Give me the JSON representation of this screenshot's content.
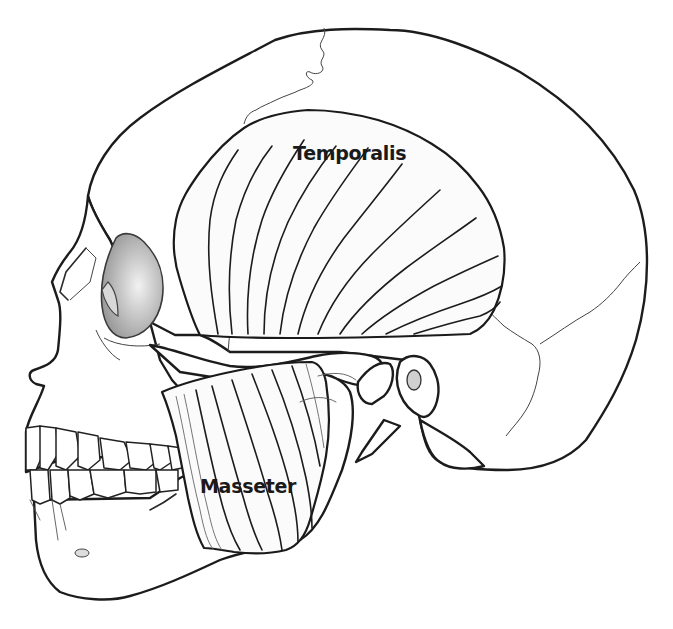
{
  "figure": {
    "labels": {
      "temporalis": "Temporalis",
      "masseter": "Masseter"
    }
  }
}
